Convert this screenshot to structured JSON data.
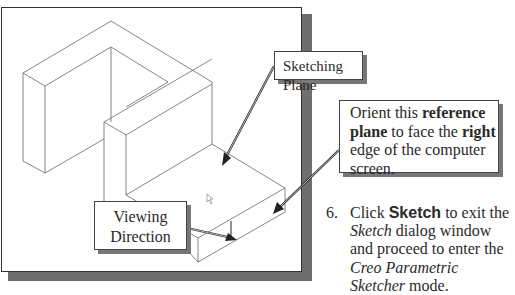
{
  "figure": {
    "callouts": {
      "sketching_plane": "Sketching Plane",
      "viewing_direction_line1": "Viewing",
      "viewing_direction_line2": "Direction",
      "orient": {
        "t1": "Orient this ",
        "b1": "reference plane",
        "t2": " to face the ",
        "b2": "right",
        "t3": " edge of the computer screen."
      }
    }
  },
  "instructions": {
    "step_number": "6.",
    "t1": "Click ",
    "button_name": "Sketch",
    "t2": " to exit the ",
    "i1": "Sketch",
    "t3": " dialog window and proceed to enter the ",
    "i2": "Creo Parametric Sketcher",
    "t4": " mode."
  },
  "colors": {
    "frame_shadow": "#6e6e6e",
    "line": "#555555",
    "text": "#2a2a2a"
  }
}
